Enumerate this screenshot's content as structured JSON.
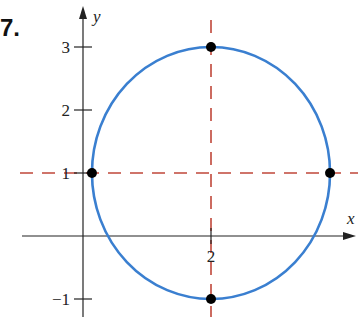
{
  "problem_number": "7.",
  "chart_data": {
    "type": "scatter",
    "title": "",
    "xlabel": "x",
    "ylabel": "y",
    "x_ticks": [
      {
        "value": 2,
        "label": "2"
      }
    ],
    "y_ticks": [
      {
        "value": 3,
        "label": "3"
      },
      {
        "value": 2,
        "label": "2"
      },
      {
        "value": 1,
        "label": "1"
      },
      {
        "value": -1,
        "label": "−1"
      }
    ],
    "xlim": [
      -1.3,
      4.4
    ],
    "ylim": [
      -1.3,
      3.5
    ],
    "grid": false,
    "curves": [
      {
        "name": "circle",
        "shape": "circle",
        "center": [
          2,
          1
        ],
        "radius": 2,
        "color": "#3a7fd0"
      }
    ],
    "guide_lines": [
      {
        "orientation": "horizontal",
        "value": 1,
        "style": "dashed",
        "color": "#c0473a"
      },
      {
        "orientation": "vertical",
        "value": 2,
        "style": "dashed",
        "color": "#c0473a"
      }
    ],
    "points": [
      {
        "x": 2,
        "y": 3
      },
      {
        "x": 0,
        "y": 1
      },
      {
        "x": 4,
        "y": 1
      },
      {
        "x": 2,
        "y": -1
      }
    ],
    "point_color": "#000000"
  }
}
